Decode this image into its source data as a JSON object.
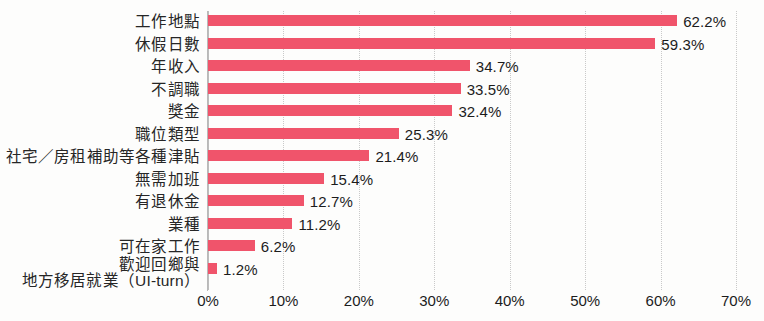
{
  "chart_data": {
    "type": "bar",
    "orientation": "horizontal",
    "title": "",
    "xlabel": "",
    "ylabel": "",
    "xlim": [
      0,
      70
    ],
    "xunit": "%",
    "grid": true,
    "legend": false,
    "bar_color": "#f0546b",
    "gridline_color": "#c9c9c9",
    "axis_color": "#b9b9b9",
    "text_color": "#1c1c1c",
    "background": "#fdfdfc",
    "xticks": [
      "0%",
      "10%",
      "20%",
      "30%",
      "40%",
      "50%",
      "60%",
      "70%"
    ],
    "xtick_values": [
      0,
      10,
      20,
      30,
      40,
      50,
      60,
      70
    ],
    "categories": [
      "工作地點",
      "休假日數",
      "年收入",
      "不調職",
      "獎金",
      "職位類型",
      "社宅／房租補助等各種津貼",
      "無需加班",
      "有退休金",
      "業種",
      "可在家工作",
      "歡迎回鄉與\n地方移居就業（UI-turn）"
    ],
    "category_lines": [
      [
        "工作地點"
      ],
      [
        "休假日數"
      ],
      [
        "年收入"
      ],
      [
        "不調職"
      ],
      [
        "獎金"
      ],
      [
        "職位類型"
      ],
      [
        "社宅／房租補助等各種津貼"
      ],
      [
        "無需加班"
      ],
      [
        "有退休金"
      ],
      [
        "業種"
      ],
      [
        "可在家工作"
      ],
      [
        "歡迎回鄉與",
        "地方移居就業（UI-turn）"
      ]
    ],
    "values": [
      62.2,
      59.3,
      34.7,
      33.5,
      32.4,
      25.3,
      21.4,
      15.4,
      12.7,
      11.2,
      6.2,
      1.2
    ],
    "value_labels": [
      "62.2%",
      "59.3%",
      "34.7%",
      "33.5%",
      "32.4%",
      "25.3%",
      "21.4%",
      "15.4%",
      "12.7%",
      "11.2%",
      "6.2%",
      "1.2%"
    ]
  }
}
